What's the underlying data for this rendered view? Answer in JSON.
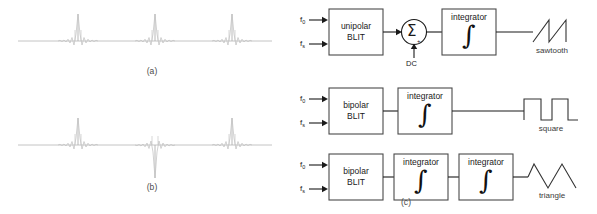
{
  "figure": {
    "panels": [
      {
        "id": "a",
        "caption": "(a)",
        "description": "unipolar BLIT impulse train"
      },
      {
        "id": "b",
        "caption": "(b)",
        "description": "bipolar BLIT impulse train"
      },
      {
        "id": "c",
        "caption": "(c)",
        "description": "block diagrams"
      }
    ]
  },
  "plot_a": {
    "caption": "(a)",
    "impulses": [
      {
        "x": 78,
        "polarity": "up"
      },
      {
        "x": 155,
        "polarity": "up"
      },
      {
        "x": 232,
        "polarity": "up"
      }
    ],
    "baseline_y": 41
  },
  "plot_b": {
    "caption": "(b)",
    "impulses": [
      {
        "x": 78,
        "polarity": "up"
      },
      {
        "x": 155,
        "polarity": "down"
      },
      {
        "x": 232,
        "polarity": "up"
      }
    ],
    "baseline_y": 145
  },
  "rows": [
    {
      "id": "sawtooth-row",
      "inputs": [
        {
          "symbol": "f",
          "subscript": "0"
        },
        {
          "symbol": "f",
          "subscript": "s"
        }
      ],
      "source_block": {
        "line1": "unipolar",
        "line2": "BLIT"
      },
      "summer": {
        "symbol": "Σ",
        "sign": "+",
        "aux_input_label": "DC"
      },
      "integrators": [
        {
          "label": "integrator",
          "symbol": "∫"
        }
      ],
      "output": {
        "label": "sawtooth",
        "type": "sawtooth"
      }
    },
    {
      "id": "square-row",
      "inputs": [
        {
          "symbol": "f",
          "subscript": "0"
        },
        {
          "symbol": "f",
          "subscript": "s"
        }
      ],
      "source_block": {
        "line1": "bipolar",
        "line2": "BLIT"
      },
      "summer": null,
      "integrators": [
        {
          "label": "integrator",
          "symbol": "∫"
        }
      ],
      "output": {
        "label": "square",
        "type": "square"
      }
    },
    {
      "id": "triangle-row",
      "inputs": [
        {
          "symbol": "f",
          "subscript": "0"
        },
        {
          "symbol": "f",
          "subscript": "s"
        }
      ],
      "source_block": {
        "line1": "bipolar",
        "line2": "BLIT"
      },
      "summer": null,
      "integrators": [
        {
          "label": "integrator",
          "symbol": "∫"
        },
        {
          "label": "integrator",
          "symbol": "∫"
        }
      ],
      "output": {
        "label": "triangle",
        "type": "triangle"
      },
      "caption": "(c)"
    }
  ],
  "colors": {
    "signal": "#b8b8b8",
    "stroke": "#333333",
    "box_border": "#4a4a4a",
    "text": "#1a1a1a",
    "caption": "#4a4a4a",
    "background": "#ffffff"
  }
}
